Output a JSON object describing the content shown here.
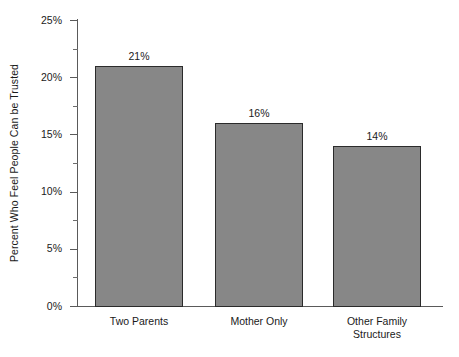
{
  "chart_data": {
    "type": "bar",
    "title": "",
    "subtitle": "",
    "xlabel": "",
    "ylabel": "Percent Who Feel People Can be Trusted",
    "categories": [
      "Two Parents",
      "Mother Only",
      "Other Family Structures"
    ],
    "category_lines": [
      [
        "Two Parents"
      ],
      [
        "Mother Only"
      ],
      [
        "Other Family",
        "Structures"
      ]
    ],
    "values": [
      21,
      16,
      14
    ],
    "value_labels": [
      "21%",
      "16%",
      "14%"
    ],
    "ylim": [
      0,
      25
    ],
    "y_ticks": [
      0,
      5,
      10,
      15,
      20,
      25
    ],
    "y_tick_labels": [
      "0%",
      "5%",
      "10%",
      "15%",
      "20%",
      "25%"
    ],
    "y_minor_ticks": [
      2.5,
      7.5,
      12.5,
      17.5,
      22.5
    ],
    "grid": false,
    "legend": "none",
    "bar_color": "#878787",
    "bar_edge_color": "#2b2b2b",
    "axis_color": "#5a5a5a",
    "text_color": "#1a1a1a",
    "background_color": "#ffffff"
  }
}
